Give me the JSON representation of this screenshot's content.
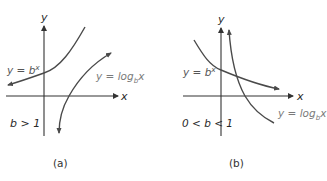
{
  "colors": {
    "axis": "#333333",
    "curve": "#4a4a4a",
    "text_dark": "#2a2a2a",
    "text_gray": "#7a7a7a"
  },
  "panels": [
    {
      "id": "a",
      "caption": "(a)",
      "y_axis_label": "y",
      "x_axis_label": "x",
      "condition": "b > 1",
      "exp_label": {
        "prefix": "y = b",
        "superscript": "x"
      },
      "log_label": {
        "prefix": "y = log",
        "subscript": "b",
        "suffix": "x"
      },
      "exp_curve": "increasing exponential through (0,1)",
      "log_curve": "increasing logarithm through (1,0)"
    },
    {
      "id": "b",
      "caption": "(b)",
      "y_axis_label": "y",
      "x_axis_label": "x",
      "condition": "0 < b < 1",
      "exp_label": {
        "prefix": "y = b",
        "superscript": "x"
      },
      "log_label": {
        "prefix": "y = log",
        "subscript": "b",
        "suffix": "x"
      },
      "exp_curve": "decreasing exponential through (0,1)",
      "log_curve": "decreasing logarithm through (1,0)"
    }
  ]
}
